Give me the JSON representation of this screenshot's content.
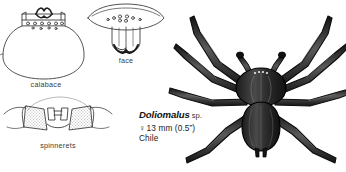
{
  "plate": {
    "background_color": "#ffffff",
    "ink_color": "#1a1a1a",
    "line_color": "#3f3f3f"
  },
  "figures": [
    {
      "id": "calabace",
      "name": "calabace-diagram",
      "caption": "calabace",
      "description": "outline drawing of gourd-shaped spider abdomen with banded ring of spots at the top"
    },
    {
      "id": "face",
      "name": "face-diagram",
      "caption": "face",
      "description": "outline drawing of spider carapace front showing eye group of eight eyes above chelicerae"
    },
    {
      "id": "spinnerets",
      "name": "spinnerets-diagram",
      "caption": "spinnerets",
      "description": "outline drawing of paired stippled spinneret turrets"
    },
    {
      "id": "spider",
      "name": "spider-habitus-illustration",
      "caption": "",
      "description": "dorsal ink illustration of a dark flattened crab-like spider with eight long spread legs"
    }
  ],
  "species_label": {
    "genus": "Doliomalus",
    "qualifier": "sp.",
    "sex_symbol": "♀",
    "size": "13 mm (0.5”)",
    "size_plain": "13 mm (0.5\")",
    "country": "Chile"
  }
}
